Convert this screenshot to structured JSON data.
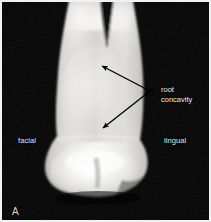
{
  "figure": {
    "panel_letter": "A",
    "background_color": "#000000",
    "frame_color": "#f2f2f2",
    "specimen": "maxillary premolar, proximal view",
    "annotation_color": "#000000",
    "label_text_color": "#e8e8e8"
  },
  "labels": {
    "facial": "facial",
    "lingual": "lingual",
    "callout_line1": "root",
    "callout_line2": "concavity"
  },
  "annotations": {
    "arrows": [
      {
        "name": "arrow-upper-root-concavity",
        "from_x": 150,
        "from_y": 91,
        "to_x": 100,
        "to_y": 65
      },
      {
        "name": "arrow-lower-root-concavity",
        "from_x": 150,
        "from_y": 91,
        "to_x": 102,
        "to_y": 128
      }
    ],
    "hub_x": 152,
    "hub_y": 91
  },
  "tooth": {
    "regions": [
      "root-buccal-prong",
      "root-lingual-prong",
      "root-bifurcation-notch",
      "root-trunk",
      "cervical-line",
      "crown",
      "occlusal-cusp-ridge"
    ],
    "highlight_color": "#f6f6f4",
    "midtone_color": "#d9d8d4",
    "shadow_color": "#8c8b88"
  }
}
